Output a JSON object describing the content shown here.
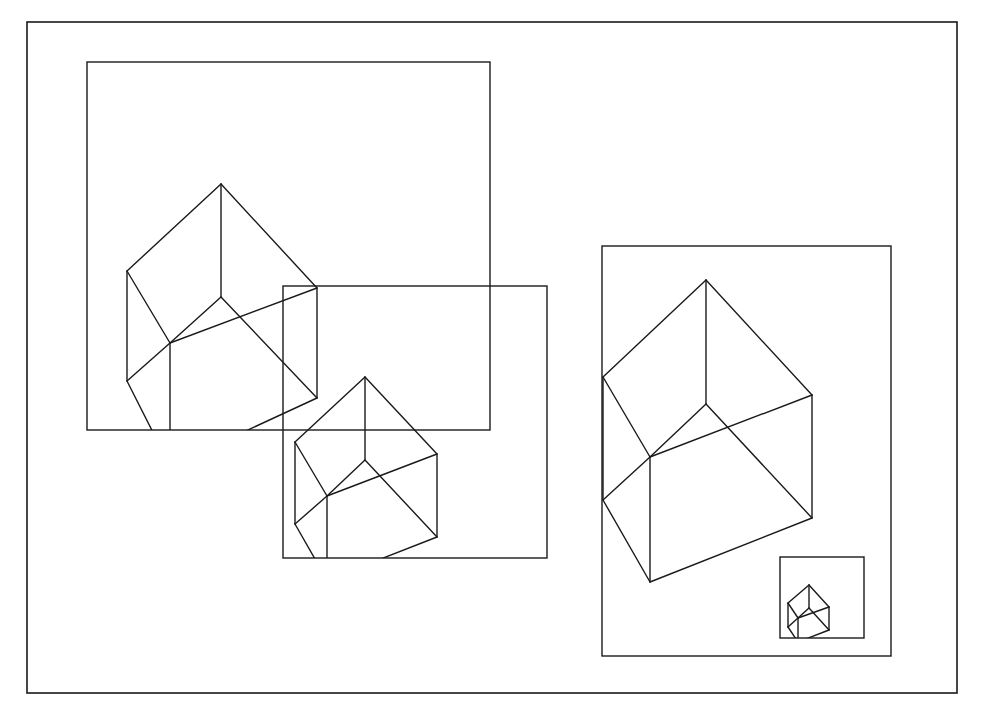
{
  "diagram": {
    "colors": {
      "background": "#ffffff",
      "stroke": "#1a1a1a"
    },
    "outer_frame": {
      "x1": 27,
      "y1": 22,
      "x2": 957,
      "y2": 693
    },
    "windows": [
      {
        "id": "window-1",
        "x1": 87,
        "y1": 62,
        "x2": 490,
        "y2": 430
      },
      {
        "id": "window-2",
        "x1": 283,
        "y1": 286,
        "x2": 547,
        "y2": 558
      },
      {
        "id": "window-3",
        "x1": 602,
        "y1": 246,
        "x2": 891,
        "y2": 656
      },
      {
        "id": "window-4",
        "x1": 780,
        "y1": 557,
        "x2": 864,
        "y2": 638
      }
    ],
    "cubes": [
      {
        "id": "cube-1",
        "clip_window": "window-1",
        "vertices": {
          "top": [
            221,
            184
          ],
          "left": [
            127,
            271
          ],
          "right": [
            317,
            288
          ],
          "center": [
            221,
            297
          ],
          "front": [
            170,
            343
          ],
          "left_bottom": [
            127,
            381
          ],
          "right_bottom": [
            317,
            398
          ],
          "bottom_front": [
            170,
            466
          ]
        }
      },
      {
        "id": "cube-2",
        "clip_window": "window-2",
        "vertices": {
          "top": [
            365,
            377
          ],
          "left": [
            295,
            442
          ],
          "right": [
            437,
            454
          ],
          "center": [
            365,
            460
          ],
          "front": [
            327,
            496
          ],
          "left_bottom": [
            295,
            524
          ],
          "right_bottom": [
            437,
            537
          ],
          "bottom_front": [
            327,
            580
          ]
        }
      },
      {
        "id": "cube-3",
        "clip_window": "window-3",
        "vertices": {
          "top": [
            706,
            280
          ],
          "left": [
            603,
            377
          ],
          "right": [
            812,
            395
          ],
          "center": [
            706,
            404
          ],
          "front": [
            650,
            457
          ],
          "left_bottom": [
            603,
            500
          ],
          "right_bottom": [
            812,
            518
          ],
          "bottom_front": [
            650,
            582
          ]
        }
      },
      {
        "id": "cube-4",
        "clip_window": "window-4",
        "vertices": {
          "top": [
            809,
            585
          ],
          "left": [
            788,
            603
          ],
          "right": [
            829,
            607
          ],
          "center": [
            809,
            608
          ],
          "front": [
            798,
            618
          ],
          "left_bottom": [
            788,
            627
          ],
          "right_bottom": [
            829,
            630
          ],
          "bottom_front": [
            798,
            642
          ]
        }
      }
    ],
    "cube_edges": [
      [
        "top",
        "left"
      ],
      [
        "top",
        "right"
      ],
      [
        "top",
        "center"
      ],
      [
        "left",
        "front"
      ],
      [
        "center",
        "front"
      ],
      [
        "front",
        "right"
      ],
      [
        "center",
        "right_bottom"
      ],
      [
        "right",
        "right_bottom"
      ],
      [
        "left",
        "left_bottom"
      ],
      [
        "left_bottom",
        "front"
      ],
      [
        "front",
        "bottom_front"
      ],
      [
        "left_bottom",
        "bottom_front"
      ],
      [
        "bottom_front",
        "right_bottom"
      ]
    ]
  }
}
